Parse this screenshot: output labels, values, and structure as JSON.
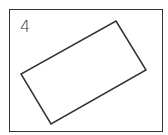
{
  "figure": {
    "label": "4",
    "stroke_color": "#333333",
    "background": "#ffffff",
    "shape": "rotated-rectangle",
    "polygon_points": "116,21 146,70 51,124 21,74"
  }
}
